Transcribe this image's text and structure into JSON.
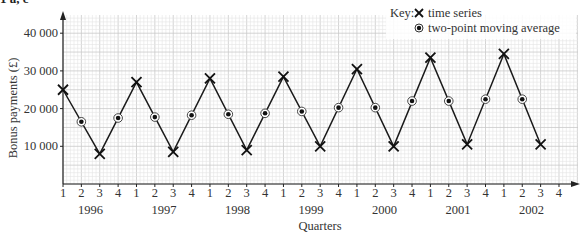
{
  "header": {
    "label": "1 a, c"
  },
  "chart_data": {
    "type": "line",
    "title": "",
    "xlabel": "Quarters",
    "ylabel": "Bonus payments (£)",
    "ylim": [
      0,
      45000
    ],
    "yticks": [
      10000,
      20000,
      30000,
      40000
    ],
    "ytick_labels": [
      "10 000",
      "20 000",
      "30 000",
      "40 000"
    ],
    "grid": true,
    "legend_position": "top-right",
    "legend_title": "Key:",
    "quarter_labels": [
      "1",
      "2",
      "3",
      "4",
      "1",
      "2",
      "3",
      "4",
      "1",
      "2",
      "3",
      "4",
      "1",
      "2",
      "3",
      "4",
      "1",
      "2",
      "3",
      "4",
      "1",
      "2",
      "3",
      "4",
      "1",
      "2",
      "3",
      "4"
    ],
    "years": [
      "1996",
      "1997",
      "1998",
      "1999",
      "2000",
      "2001",
      "2002"
    ],
    "series": [
      {
        "name": "time series",
        "marker": "cross",
        "points": [
          {
            "year": "1996",
            "quarter": 1,
            "value": 25000
          },
          {
            "year": "1996",
            "quarter": 3,
            "value": 8000
          },
          {
            "year": "1997",
            "quarter": 1,
            "value": 27000
          },
          {
            "year": "1997",
            "quarter": 3,
            "value": 8500
          },
          {
            "year": "1998",
            "quarter": 1,
            "value": 28000
          },
          {
            "year": "1998",
            "quarter": 3,
            "value": 9000
          },
          {
            "year": "1999",
            "quarter": 1,
            "value": 28500
          },
          {
            "year": "1999",
            "quarter": 3,
            "value": 10000
          },
          {
            "year": "2000",
            "quarter": 1,
            "value": 30500
          },
          {
            "year": "2000",
            "quarter": 3,
            "value": 10000
          },
          {
            "year": "2001",
            "quarter": 1,
            "value": 33500
          },
          {
            "year": "2001",
            "quarter": 3,
            "value": 10500
          },
          {
            "year": "2002",
            "quarter": 1,
            "value": 34500
          },
          {
            "year": "2002",
            "quarter": 3,
            "value": 10500
          }
        ]
      },
      {
        "name": "two-point moving average",
        "marker": "circled-dot",
        "points": [
          {
            "year": "1996",
            "quarter": 2,
            "value": 16500
          },
          {
            "year": "1996",
            "quarter": 4,
            "value": 17500
          },
          {
            "year": "1997",
            "quarter": 2,
            "value": 17750
          },
          {
            "year": "1997",
            "quarter": 4,
            "value": 18250
          },
          {
            "year": "1998",
            "quarter": 2,
            "value": 18500
          },
          {
            "year": "1998",
            "quarter": 4,
            "value": 18750
          },
          {
            "year": "1999",
            "quarter": 2,
            "value": 19250
          },
          {
            "year": "1999",
            "quarter": 4,
            "value": 20250
          },
          {
            "year": "2000",
            "quarter": 2,
            "value": 20250
          },
          {
            "year": "2000",
            "quarter": 4,
            "value": 22000
          },
          {
            "year": "2001",
            "quarter": 2,
            "value": 22000
          },
          {
            "year": "2001",
            "quarter": 4,
            "value": 22500
          },
          {
            "year": "2002",
            "quarter": 2,
            "value": 22500
          }
        ]
      }
    ]
  }
}
